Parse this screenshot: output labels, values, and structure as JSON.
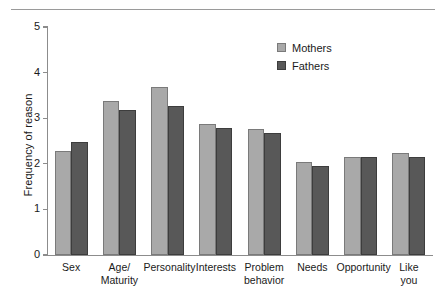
{
  "chart_data": {
    "type": "bar",
    "title": "",
    "subtitle": "",
    "xlabel": "",
    "ylabel": "Frequency of reason",
    "ylim": [
      0,
      5
    ],
    "yticks": [
      "0",
      "1",
      "2",
      "3",
      "4",
      "5"
    ],
    "grid": false,
    "legend_position": "top-right",
    "categories": [
      "Sex",
      "Age/\nMaturity",
      "Personality",
      "Interests",
      "Problem\nbehavior",
      "Needs",
      "Opportunity",
      "Like\nyou"
    ],
    "category_lines": [
      [
        "Sex"
      ],
      [
        "Age/",
        "Maturity"
      ],
      [
        "Personality"
      ],
      [
        "Interests"
      ],
      [
        "Problem",
        "behavior"
      ],
      [
        "Needs"
      ],
      [
        "Opportunity"
      ],
      [
        "Like",
        "you"
      ]
    ],
    "series": [
      {
        "name": "Mothers",
        "color": "#a9a9a9",
        "values": [
          2.28,
          3.38,
          3.69,
          2.88,
          2.77,
          2.05,
          2.15,
          2.23
        ]
      },
      {
        "name": "Fathers",
        "color": "#585858",
        "values": [
          2.48,
          3.18,
          3.27,
          2.78,
          2.67,
          1.95,
          2.15,
          2.15
        ]
      }
    ]
  },
  "legend": {
    "items": [
      {
        "label": "Mothers"
      },
      {
        "label": "Fathers"
      }
    ]
  },
  "axes": {
    "y_title": "Frequency of reason",
    "y_tick_labels": [
      "5",
      "4",
      "3",
      "2",
      "1",
      "0"
    ]
  },
  "colors": {
    "mothers": "#a9a9a9",
    "fathers": "#585858",
    "axis": "#8c8c8c",
    "rule": "#9a9a9a",
    "background": "#ffffff"
  }
}
